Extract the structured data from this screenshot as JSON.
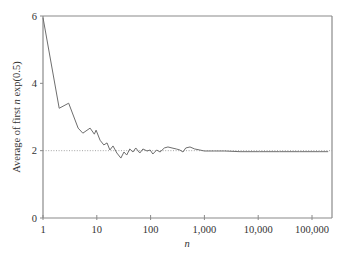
{
  "chart_data": {
    "type": "line",
    "title": "",
    "xlabel": "n",
    "ylabel_parts": [
      "Average of first ",
      "n",
      " exp(0.5)"
    ],
    "ylabel": "Average of first n exp(0.5)",
    "xscale": "log",
    "xlim": [
      1,
      200000
    ],
    "ylim": [
      0,
      6
    ],
    "xticks": [
      1,
      10,
      100,
      1000,
      10000,
      100000
    ],
    "xtick_labels": [
      "1",
      "10",
      "100",
      "1,000",
      "10,000",
      "100,000"
    ],
    "yticks": [
      0,
      2,
      4,
      6
    ],
    "ytick_labels": [
      "0",
      "2",
      "4",
      "6"
    ],
    "grid": false,
    "legend": "none",
    "reference_line": {
      "y": 2,
      "style": "dotted",
      "color": "#9a9a9a"
    },
    "series": [
      {
        "name": "running average",
        "color": "#6e6e6e",
        "points": [
          [
            1,
            5.95
          ],
          [
            2,
            3.26
          ],
          [
            3,
            3.41
          ],
          [
            4.5,
            2.67
          ],
          [
            5.5,
            2.52
          ],
          [
            7.5,
            2.67
          ],
          [
            9,
            2.49
          ],
          [
            9.7,
            2.61
          ],
          [
            11.5,
            2.31
          ],
          [
            13.5,
            2.17
          ],
          [
            15.5,
            2.23
          ],
          [
            17.5,
            2.02
          ],
          [
            20,
            2.14
          ],
          [
            23.6,
            1.93
          ],
          [
            28,
            1.78
          ],
          [
            32,
            1.96
          ],
          [
            36,
            1.87
          ],
          [
            41,
            2.05
          ],
          [
            47,
            1.96
          ],
          [
            53,
            2.08
          ],
          [
            63,
            1.93
          ],
          [
            72,
            2.05
          ],
          [
            86,
            1.99
          ],
          [
            98,
            2.02
          ],
          [
            110,
            1.9
          ],
          [
            130,
            2.02
          ],
          [
            150,
            1.96
          ],
          [
            180,
            2.08
          ],
          [
            210,
            2.11
          ],
          [
            250,
            2.08
          ],
          [
            300,
            2.05
          ],
          [
            350,
            2.02
          ],
          [
            400,
            1.96
          ],
          [
            450,
            2.08
          ],
          [
            540,
            2.11
          ],
          [
            660,
            2.05
          ],
          [
            820,
            2.02
          ],
          [
            1000,
            1.99
          ],
          [
            1540,
            1.99
          ],
          [
            2400,
            1.99
          ],
          [
            4600,
            1.97
          ],
          [
            10500,
            1.97
          ],
          [
            25000,
            1.97
          ],
          [
            59000,
            1.97
          ],
          [
            140000,
            1.97
          ],
          [
            200000,
            1.97
          ]
        ]
      }
    ]
  },
  "colors": {
    "axis": "#8a8a8a",
    "frame": "#8a8a8a",
    "text": "#333333"
  }
}
